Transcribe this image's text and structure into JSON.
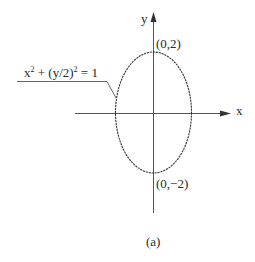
{
  "diagram": {
    "axes": {
      "x_label": "x",
      "y_label": "y"
    },
    "curve": {
      "equation_lhs_x": "x",
      "equation_exp": "2",
      "equation_mid": " + (y/2)",
      "equation_exp2": "2",
      "equation_rhs": " = 1",
      "type": "ellipse",
      "semi_axis_x": 1,
      "semi_axis_y": 2
    },
    "points": {
      "top": "(0,2)",
      "bottom": "(0,−2)"
    },
    "caption": "(a)",
    "colors": {
      "stroke": "#333333",
      "axis": "#555555",
      "text": "#2a2a2a"
    }
  }
}
